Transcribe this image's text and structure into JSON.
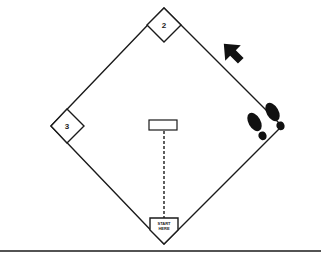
{
  "diagram": {
    "type": "baseball-diamond",
    "bases": [
      {
        "id": "second",
        "label": "2"
      },
      {
        "id": "third",
        "label": "3"
      },
      {
        "id": "home",
        "label_line1": "START",
        "label_line2": "HERE"
      }
    ],
    "elements": [
      "pitcher-rubber",
      "dashed-line-home-to-rubber",
      "direction-arrow",
      "footprints"
    ],
    "colors": {
      "line": "#1a1a1a",
      "fill": "#ffffff",
      "ink": "#111111"
    }
  }
}
